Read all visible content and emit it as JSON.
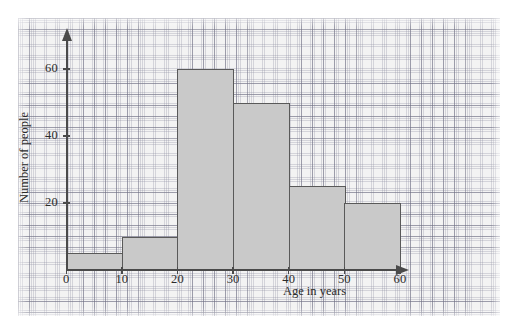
{
  "chart_data": {
    "type": "bar",
    "title": "",
    "xlabel": "Age in years",
    "ylabel": "Number of people",
    "categories": [
      "0-10",
      "10-20",
      "20-30",
      "30-40",
      "40-50",
      "50-60"
    ],
    "values": [
      5,
      10,
      60,
      50,
      25,
      20
    ],
    "bin_edges": [
      0,
      10,
      20,
      30,
      40,
      50,
      60
    ],
    "xlim": [
      0,
      60
    ],
    "ylim": [
      0,
      65
    ],
    "x_ticks": [
      "0",
      "10",
      "20",
      "30",
      "40",
      "50",
      "60"
    ],
    "y_ticks": [
      "20",
      "40",
      "60"
    ],
    "grid": true,
    "grid_style": "graph-paper",
    "legend": "none",
    "bar_fill_color": "#c9c9c9",
    "bar_edge_color": "#595959",
    "axis_color": "#4a4a4a",
    "paper_color": "#f3f3f3"
  },
  "axes": {
    "x_title": "Age in years",
    "y_title": "Number of people"
  },
  "ticks": {
    "y": [
      {
        "label": "20",
        "value": 20
      },
      {
        "label": "40",
        "value": 40
      },
      {
        "label": "60",
        "value": 60
      }
    ],
    "x": [
      {
        "label": "0",
        "value": 0
      },
      {
        "label": "10",
        "value": 10
      },
      {
        "label": "20",
        "value": 20
      },
      {
        "label": "30",
        "value": 30
      },
      {
        "label": "40",
        "value": 40
      },
      {
        "label": "50",
        "value": 50
      },
      {
        "label": "60",
        "value": 60
      }
    ]
  },
  "bars": [
    {
      "label": "0-10",
      "value": 5
    },
    {
      "label": "10-20",
      "value": 10
    },
    {
      "label": "20-30",
      "value": 60
    },
    {
      "label": "30-40",
      "value": 50
    },
    {
      "label": "40-50",
      "value": 25
    },
    {
      "label": "50-60",
      "value": 20
    }
  ]
}
